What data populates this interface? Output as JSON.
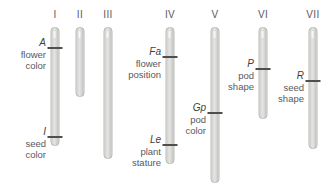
{
  "figure": {
    "background_color": "#ffffff",
    "chromosome_fill_color": "#dcdcda",
    "chromosome_border_color": "#b8b8b6",
    "locus_tick_color": "#4f4f50",
    "text_color": "#58595b",
    "width": 332,
    "height": 185
  },
  "chromosomes": [
    {
      "label": "I",
      "center_x": 55,
      "top": 27,
      "bottom": 146,
      "width": 9,
      "loci": [
        {
          "symbol": "A",
          "trait_lines": [
            "flower",
            "color"
          ],
          "tick_y": 47,
          "tick_width": 15,
          "label_right_x": 46,
          "label_top_y": 37
        },
        {
          "symbol": "I",
          "trait_lines": [
            "seed",
            "color"
          ],
          "tick_y": 136,
          "tick_width": 15,
          "label_right_x": 46,
          "label_top_y": 126
        }
      ]
    },
    {
      "label": "II",
      "center_x": 80,
      "top": 27,
      "bottom": 97,
      "width": 9,
      "loci": []
    },
    {
      "label": "III",
      "center_x": 108,
      "top": 27,
      "bottom": 159,
      "width": 9,
      "loci": []
    },
    {
      "label": "IV",
      "center_x": 170,
      "top": 27,
      "bottom": 164,
      "width": 9,
      "loci": [
        {
          "symbol": "Fa",
          "trait_lines": [
            "flower",
            "position"
          ],
          "tick_y": 56,
          "tick_width": 15,
          "label_right_x": 161,
          "label_top_y": 46
        },
        {
          "symbol": "Le",
          "trait_lines": [
            "plant",
            "stature"
          ],
          "tick_y": 144,
          "tick_width": 15,
          "label_right_x": 161,
          "label_top_y": 134
        }
      ]
    },
    {
      "label": "V",
      "center_x": 215,
      "top": 27,
      "bottom": 183,
      "width": 9,
      "loci": [
        {
          "symbol": "Gp",
          "trait_lines": [
            "pod",
            "color"
          ],
          "tick_y": 112,
          "tick_width": 15,
          "label_right_x": 206,
          "label_top_y": 102
        }
      ]
    },
    {
      "label": "VI",
      "center_x": 263,
      "top": 27,
      "bottom": 119,
      "width": 9,
      "loci": [
        {
          "symbol": "P",
          "trait_lines": [
            "pod",
            "shape"
          ],
          "tick_y": 68,
          "tick_width": 15,
          "label_right_x": 254,
          "label_top_y": 58
        }
      ]
    },
    {
      "label": "VII",
      "center_x": 313,
      "top": 27,
      "bottom": 149,
      "width": 9,
      "loci": [
        {
          "symbol": "R",
          "trait_lines": [
            "seed",
            "shape"
          ],
          "tick_y": 80,
          "tick_width": 15,
          "label_right_x": 304,
          "label_top_y": 70
        }
      ]
    }
  ]
}
